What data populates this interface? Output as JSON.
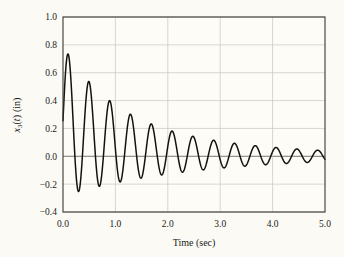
{
  "chart_data": {
    "type": "line",
    "title": "",
    "xlabel": "Time (sec)",
    "ylabel": "x3(t) (in)",
    "ylabel_parts": {
      "base": "x",
      "subscript": "3",
      "variable": "(t)",
      "units": "(in)"
    },
    "xlim": [
      0.0,
      5.0
    ],
    "ylim": [
      -0.4,
      1.0
    ],
    "xticks": [
      "0.0",
      "1.0",
      "2.0",
      "3.0",
      "4.0",
      "5.0"
    ],
    "xtick_values": [
      0.0,
      1.0,
      2.0,
      3.0,
      4.0,
      5.0
    ],
    "yticks": [
      "1.0",
      "0.8",
      "0.6",
      "0.4",
      "0.2",
      "0.0",
      "-0.2",
      "-0.4"
    ],
    "ytick_values": [
      1.0,
      0.8,
      0.6,
      0.4,
      0.2,
      0.0,
      -0.2,
      -0.4
    ],
    "grid": true,
    "grid_color": "#c9c7bd",
    "legend": null,
    "background_color": "#fbfaf5",
    "plot_background_color": "#fdfcf7",
    "line_color": "#15120e",
    "line_width": 1.5,
    "axis_color": "#3a3730",
    "series": [
      {
        "name": "x3(t)",
        "description": "Decaying oscillatory response with decaying mean offset",
        "model": {
          "kind": "sum_of_damped_sinusoids",
          "components": [
            {
              "amplitude": 0.285,
              "frequency_hz": 2.52,
              "phase_rad": -1.5708,
              "decay_rate": 0.4
            },
            {
              "amplitude": 0.255,
              "frequency_hz": 2.52,
              "phase_rad": -1.5708,
              "decay_rate": 1.05,
              "offset_mode": true
            }
          ],
          "baseline": 0.0,
          "samples": 1400
        },
        "annotated_peaks": [
          {
            "t": 0.2,
            "value": 0.62
          },
          {
            "t": 0.6,
            "value": 0.51
          },
          {
            "t": 1.0,
            "value": 0.42
          },
          {
            "t": 1.4,
            "value": 0.39
          },
          {
            "t": 1.86,
            "value": 0.29
          },
          {
            "t": 2.26,
            "value": 0.24
          },
          {
            "t": 2.66,
            "value": 0.2
          },
          {
            "t": 3.06,
            "value": 0.17
          },
          {
            "t": 3.46,
            "value": 0.135
          },
          {
            "t": 3.92,
            "value": 0.11
          },
          {
            "t": 4.32,
            "value": 0.09
          },
          {
            "t": 4.72,
            "value": 0.075
          }
        ],
        "annotated_troughs": [
          {
            "t": 0.42,
            "value": 0.035
          },
          {
            "t": 0.82,
            "value": 0.035
          },
          {
            "t": 1.22,
            "value": 0.055
          },
          {
            "t": 1.66,
            "value": -0.305
          },
          {
            "t": 2.06,
            "value": -0.265
          },
          {
            "t": 2.48,
            "value": -0.22
          },
          {
            "t": 2.88,
            "value": -0.175
          },
          {
            "t": 3.28,
            "value": -0.145
          },
          {
            "t": 3.7,
            "value": -0.12
          },
          {
            "t": 4.1,
            "value": -0.1
          },
          {
            "t": 4.5,
            "value": -0.085
          },
          {
            "t": 4.9,
            "value": -0.07
          }
        ],
        "start_value": 0.06,
        "end_value": -0.06
      }
    ]
  },
  "layout": {
    "plot_left": 63,
    "plot_top": 17,
    "plot_right": 325,
    "plot_bottom": 212,
    "xlabel_x": 194,
    "xlabel_y": 246,
    "ylabel_x": 20,
    "ylabel_y": 115
  }
}
